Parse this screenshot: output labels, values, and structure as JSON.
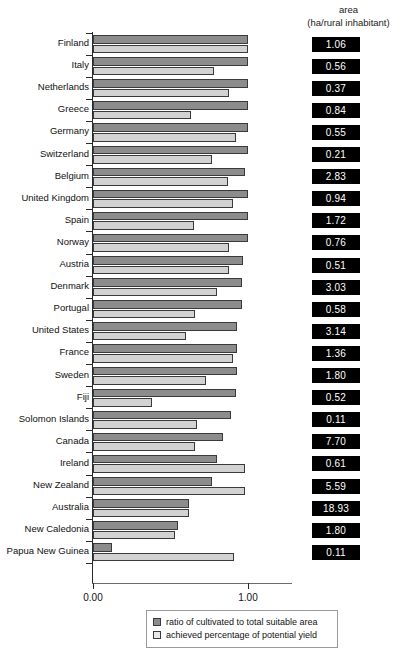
{
  "header": {
    "line1": "area",
    "line2": "(ha/rural inhabitant)"
  },
  "axis": {
    "tick_0": "0.00",
    "tick_1": "1.00"
  },
  "legend": {
    "items": [
      {
        "label": "ratio of cultivated to total suitable area",
        "swatch": "dark"
      },
      {
        "label": "achieved percentage of potential yield",
        "swatch": "light"
      }
    ]
  },
  "chart_data": {
    "type": "bar",
    "orientation": "horizontal",
    "title": "",
    "subtitle": "",
    "xlabel": "",
    "ylabel": "",
    "xlim": [
      0,
      1.07
    ],
    "xticks": [
      0.0,
      1.0
    ],
    "xticklabels": [
      "0.00",
      "1.00"
    ],
    "grid": false,
    "legend_position": "bottom",
    "categories": [
      "Finland",
      "Italy",
      "Netherlands",
      "Greece",
      "Germany",
      "Switzerland",
      "Belgium",
      "United Kingdom",
      "Spain",
      "Norway",
      "Austria",
      "Denmark",
      "Portugal",
      "United States",
      "France",
      "Sweden",
      "Fiji",
      "Solomon Islands",
      "Canada",
      "Ireland",
      "New Zealand",
      "Australia",
      "New Caledonia",
      "Papua New Guinea"
    ],
    "series": [
      {
        "name": "ratio of cultivated to total suitable area",
        "color": "#8c8c8c",
        "values": [
          1.0,
          1.0,
          1.0,
          1.0,
          1.0,
          1.0,
          0.98,
          1.0,
          1.0,
          1.0,
          0.97,
          0.96,
          0.96,
          0.93,
          0.93,
          0.93,
          0.92,
          0.89,
          0.84,
          0.8,
          0.77,
          0.62,
          0.55,
          0.12
        ]
      },
      {
        "name": "achieved percentage of potential yield",
        "color": "#d2d2d2",
        "values": [
          1.0,
          0.78,
          0.88,
          0.63,
          0.92,
          0.77,
          0.87,
          0.9,
          0.65,
          0.88,
          0.88,
          0.8,
          0.66,
          0.6,
          0.9,
          0.73,
          0.38,
          0.67,
          0.66,
          0.98,
          0.98,
          0.62,
          0.53,
          0.91
        ]
      }
    ],
    "annotations": {
      "label": "area (ha/rural inhabitant)",
      "values": [
        "1.06",
        "0.56",
        "0.37",
        "0.84",
        "0.55",
        "0.21",
        "2.83",
        "0.94",
        "1.72",
        "0.76",
        "0.51",
        "3.03",
        "0.58",
        "3.14",
        "1.36",
        "1.80",
        "0.52",
        "0.11",
        "7.70",
        "0.61",
        "5.59",
        "18.93",
        "1.80",
        "0.11"
      ]
    }
  }
}
